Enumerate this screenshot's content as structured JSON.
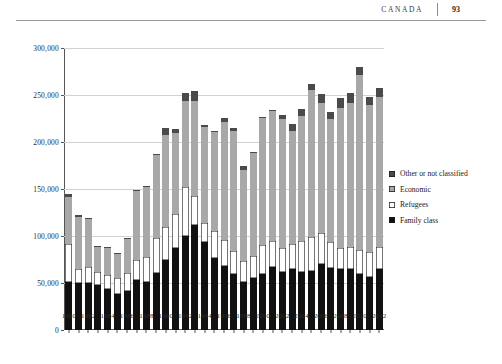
{
  "page_header": {
    "title": "CANADA",
    "page_number": "93"
  },
  "legend": {
    "items": [
      {
        "label": "Other or not classified",
        "color": "#4a4a4a",
        "swatch": "sw-other"
      },
      {
        "label": "Economic",
        "color": "#a8a8a8",
        "swatch": "sw-economic"
      },
      {
        "label": "Refugees",
        "color": "#ffffff",
        "swatch": "sw-refugees"
      },
      {
        "label": "Family class",
        "color": "#111111",
        "swatch": "sw-family"
      }
    ]
  },
  "chart_data": {
    "type": "bar",
    "stacked": true,
    "title": "",
    "xlabel": "",
    "ylabel": "",
    "ylim": [
      0,
      300000
    ],
    "ytick_labels": [
      "300,000",
      "250,000",
      "200,000",
      "150,000",
      "100,000",
      "50,000",
      "0"
    ],
    "ytick_values": [
      300000,
      250000,
      200000,
      150000,
      100000,
      50000,
      0
    ],
    "grid": true,
    "legend_position": "right",
    "categories": [
      "1980",
      "1981",
      "1982",
      "1983",
      "1984",
      "1985",
      "1986",
      "1987",
      "1988",
      "1989",
      "1990",
      "1991",
      "1992",
      "1993",
      "1994",
      "1995",
      "1996",
      "1997",
      "1998",
      "1999",
      "2000",
      "2001",
      "2002",
      "2003",
      "2004",
      "2005",
      "2006",
      "2007",
      "2008",
      "2009",
      "2010",
      "2011",
      "2012"
    ],
    "xtick_labels": [
      "1980",
      "1982",
      "1984",
      "1986",
      "1988",
      "1990",
      "1992",
      "1994",
      "1996",
      "1998",
      "2000",
      "2002",
      "2004",
      "2006",
      "2008",
      "2010",
      "2012"
    ],
    "series": [
      {
        "name": "Family class",
        "color": "#111111",
        "values": [
          51000,
          50000,
          50000,
          48000,
          44000,
          38000,
          42000,
          53000,
          51000,
          61000,
          74000,
          87000,
          100000,
          112000,
          94000,
          77000,
          68000,
          60000,
          51000,
          55000,
          60000,
          67000,
          62000,
          65000,
          62000,
          63000,
          70000,
          66000,
          65000,
          65000,
          60000,
          56000,
          65000
        ]
      },
      {
        "name": "Refugees",
        "color": "#ffffff",
        "values": [
          40000,
          15000,
          17000,
          14000,
          15000,
          17000,
          19000,
          22000,
          27000,
          37000,
          36000,
          36000,
          52000,
          31000,
          20000,
          28000,
          28000,
          24000,
          22000,
          24000,
          30000,
          28000,
          25000,
          26000,
          33000,
          36000,
          33000,
          28000,
          22000,
          23000,
          25000,
          27000,
          23000
        ]
      },
      {
        "name": "Economic",
        "color": "#a8a8a8",
        "values": [
          51000,
          55000,
          51000,
          26000,
          28000,
          26000,
          36000,
          73000,
          74000,
          88000,
          97000,
          87000,
          92000,
          101000,
          102000,
          106000,
          125000,
          128000,
          97000,
          109000,
          136000,
          138000,
          138000,
          121000,
          133000,
          156000,
          139000,
          131000,
          149000,
          153000,
          186000,
          156000,
          160000
        ]
      },
      {
        "name": "Other or not classified",
        "color": "#4a4a4a",
        "values": [
          3000,
          2000,
          1000,
          1000,
          1000,
          1000,
          1000,
          1000,
          1000,
          1000,
          8000,
          4000,
          8000,
          10000,
          2000,
          1000,
          5000,
          3000,
          4000,
          1000,
          1000,
          1000,
          4000,
          7000,
          7000,
          7000,
          9000,
          7000,
          11000,
          11000,
          9000,
          9000,
          9000
        ]
      }
    ]
  }
}
